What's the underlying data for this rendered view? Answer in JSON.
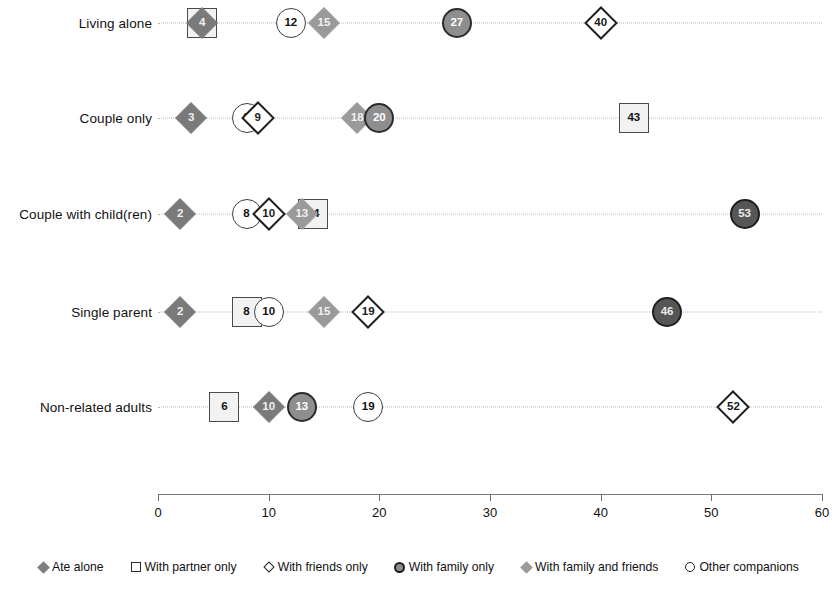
{
  "chart_data": {
    "type": "scatter",
    "title": "",
    "xlabel": "",
    "ylabel": "",
    "xlim": [
      0,
      60
    ],
    "xticks": [
      0,
      10,
      20,
      30,
      40,
      50,
      60
    ],
    "xtick_labels": [
      "0",
      "10",
      "20",
      "30",
      "40",
      "50",
      "60"
    ],
    "grid": true,
    "legend_position": "bottom",
    "categories": [
      "Living alone",
      "Couple only",
      "Couple with child(ren)",
      "Single parent",
      "Non-related adults"
    ],
    "series": [
      {
        "name": "Ate alone",
        "marker": "diamond-dark",
        "color": "#7a7a7a",
        "values": [
          4,
          3,
          2,
          2,
          10
        ]
      },
      {
        "name": "With partner only",
        "marker": "square-open",
        "color": "#f2f2f2",
        "values": [
          4,
          43,
          14,
          8,
          6
        ]
      },
      {
        "name": "With friends only",
        "marker": "diamond-open",
        "color": "#ffffff",
        "values": [
          40,
          9,
          10,
          19,
          52
        ]
      },
      {
        "name": "With family only",
        "marker": "circle-filled-gray",
        "color": "#8e8e8e",
        "values": [
          27,
          20,
          53,
          46,
          13
        ]
      },
      {
        "name": "With family and friends",
        "marker": "diamond-mid-gray",
        "color": "#9a9a9a",
        "values": [
          15,
          18,
          13,
          15,
          10
        ]
      },
      {
        "name": "Other companions",
        "marker": "circle-open",
        "color": "#ffffff",
        "values": [
          12,
          8,
          8,
          10,
          19
        ]
      }
    ],
    "points": [
      {
        "row": 0,
        "row_label": "Living alone",
        "value": 4,
        "series": "With partner only",
        "shape": "square-open",
        "label": ""
      },
      {
        "row": 0,
        "row_label": "Living alone",
        "value": 4,
        "series": "Ate alone",
        "shape": "diamond-dark",
        "label": "4"
      },
      {
        "row": 0,
        "row_label": "Living alone",
        "value": 12,
        "series": "Other companions",
        "shape": "circle-open",
        "label": "12"
      },
      {
        "row": 0,
        "row_label": "Living alone",
        "value": 15,
        "series": "With family and friends",
        "shape": "diamond-mid-gray",
        "label": "15"
      },
      {
        "row": 0,
        "row_label": "Living alone",
        "value": 27,
        "series": "With family only",
        "shape": "circle-filled-gray",
        "label": "27"
      },
      {
        "row": 0,
        "row_label": "Living alone",
        "value": 40,
        "series": "With friends only",
        "shape": "diamond-open",
        "label": "40"
      },
      {
        "row": 1,
        "row_label": "Couple only",
        "value": 3,
        "series": "Ate alone",
        "shape": "diamond-dark",
        "label": "3"
      },
      {
        "row": 1,
        "row_label": "Couple only",
        "value": 8,
        "series": "Other companions",
        "shape": "circle-open",
        "label": "8"
      },
      {
        "row": 1,
        "row_label": "Couple only",
        "value": 9,
        "series": "With friends only",
        "shape": "diamond-open",
        "label": "9"
      },
      {
        "row": 1,
        "row_label": "Couple only",
        "value": 18,
        "series": "With family and friends",
        "shape": "diamond-mid-gray",
        "label": "18"
      },
      {
        "row": 1,
        "row_label": "Couple only",
        "value": 20,
        "series": "With family only",
        "shape": "circle-filled-gray",
        "label": "20"
      },
      {
        "row": 1,
        "row_label": "Couple only",
        "value": 43,
        "series": "With partner only",
        "shape": "square-open",
        "label": "43"
      },
      {
        "row": 2,
        "row_label": "Couple with child(ren)",
        "value": 2,
        "series": "Ate alone",
        "shape": "diamond-dark",
        "label": "2"
      },
      {
        "row": 2,
        "row_label": "Couple with child(ren)",
        "value": 8,
        "series": "Other companions",
        "shape": "circle-open",
        "label": "8"
      },
      {
        "row": 2,
        "row_label": "Couple with child(ren)",
        "value": 10,
        "series": "With friends only",
        "shape": "diamond-open",
        "label": "10"
      },
      {
        "row": 2,
        "row_label": "Couple with child(ren)",
        "value": 14,
        "series": "With partner only",
        "shape": "square-open",
        "label": "14"
      },
      {
        "row": 2,
        "row_label": "Couple with child(ren)",
        "value": 13,
        "series": "With family and friends",
        "shape": "diamond-mid-gray",
        "label": "13"
      },
      {
        "row": 2,
        "row_label": "Couple with child(ren)",
        "value": 53,
        "series": "With family only",
        "shape": "circle-dark",
        "label": "53"
      },
      {
        "row": 3,
        "row_label": "Single parent",
        "value": 2,
        "series": "Ate alone",
        "shape": "diamond-dark",
        "label": "2"
      },
      {
        "row": 3,
        "row_label": "Single parent",
        "value": 8,
        "series": "With partner only",
        "shape": "square-open",
        "label": "8"
      },
      {
        "row": 3,
        "row_label": "Single parent",
        "value": 10,
        "series": "Other companions",
        "shape": "circle-open",
        "label": "10"
      },
      {
        "row": 3,
        "row_label": "Single parent",
        "value": 15,
        "series": "With family and friends",
        "shape": "diamond-mid-gray",
        "label": "15"
      },
      {
        "row": 3,
        "row_label": "Single parent",
        "value": 19,
        "series": "With friends only",
        "shape": "diamond-open",
        "label": "19"
      },
      {
        "row": 3,
        "row_label": "Single parent",
        "value": 46,
        "series": "With family only",
        "shape": "circle-dark",
        "label": "46"
      },
      {
        "row": 4,
        "row_label": "Non-related adults",
        "value": 6,
        "series": "With partner only",
        "shape": "square-open",
        "label": "6"
      },
      {
        "row": 4,
        "row_label": "Non-related adults",
        "value": 10,
        "series": "Ate alone",
        "shape": "diamond-dark",
        "label": "10"
      },
      {
        "row": 4,
        "row_label": "Non-related adults",
        "value": 13,
        "series": "With family only",
        "shape": "circle-filled-gray",
        "label": "13"
      },
      {
        "row": 4,
        "row_label": "Non-related adults",
        "value": 19,
        "series": "Other companions",
        "shape": "circle-open",
        "label": "19"
      },
      {
        "row": 4,
        "row_label": "Non-related adults",
        "value": 52,
        "series": "With friends only",
        "shape": "diamond-open",
        "label": "52"
      }
    ],
    "legend": [
      {
        "label": "Ate alone",
        "glyph": "diamond-dark-icon"
      },
      {
        "label": "With partner only",
        "glyph": "square-open-icon"
      },
      {
        "label": "With friends only",
        "glyph": "diamond-open-icon"
      },
      {
        "label": "With family only",
        "glyph": "circle-family-icon"
      },
      {
        "label": "With family and friends",
        "glyph": "diamond-mid-icon"
      },
      {
        "label": "Other companions",
        "glyph": "circle-open-icon"
      }
    ]
  },
  "colors": {
    "diamond_dark": "#7a7a7a",
    "diamond_mid": "#9a9a9a",
    "circle_family": "#8e8e8e",
    "circle_dark": "#565656",
    "square_fill": "#f2f2f2",
    "axis": "#7a7a7a",
    "gridline": "#b9b9b9"
  }
}
